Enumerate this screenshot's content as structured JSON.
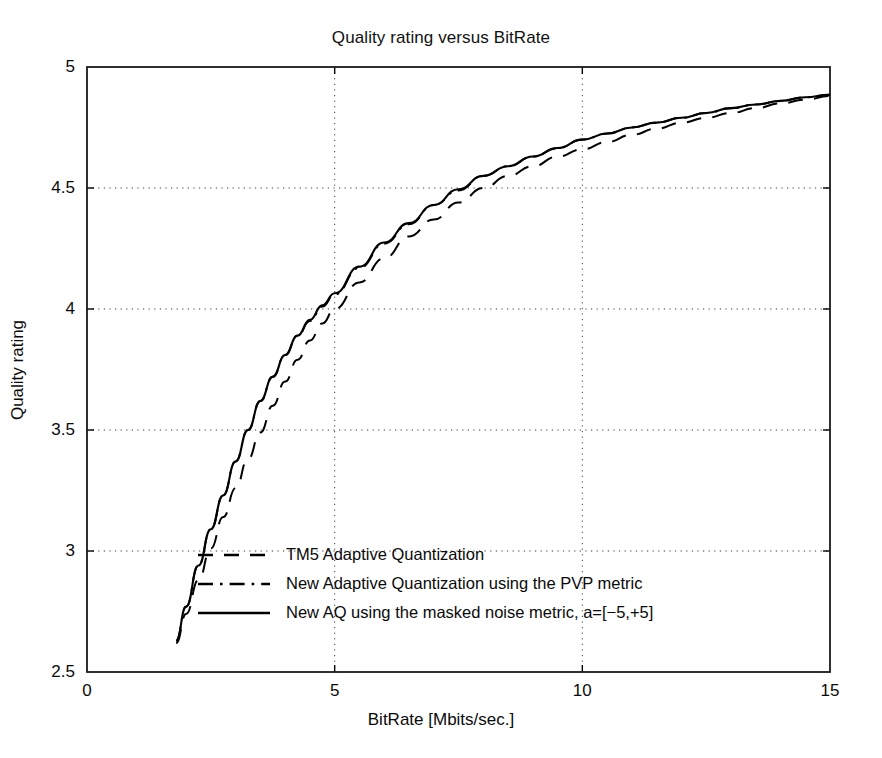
{
  "chart_data": {
    "type": "line",
    "title": "Quality rating versus BitRate",
    "xlabel": "BitRate [Mbits/sec.]",
    "ylabel": "Quality rating",
    "xlim": [
      0,
      15
    ],
    "ylim": [
      2.5,
      5
    ],
    "xticks": [
      0,
      5,
      10,
      15
    ],
    "xtick_labels": [
      "0",
      "5",
      "10",
      "15"
    ],
    "yticks": [
      2.5,
      3,
      3.5,
      4,
      4.5,
      5
    ],
    "ytick_labels": [
      "2.5",
      "3",
      "3.5",
      "4",
      "4.5",
      "5"
    ],
    "grid": "dotted-major",
    "legend_position": "lower-center-inside",
    "series": [
      {
        "name": "TM5 Adaptive Quantization",
        "style": "dashed",
        "color": "#000000",
        "x": [
          1.8,
          2.0,
          2.25,
          2.5,
          2.75,
          3.0,
          3.25,
          3.5,
          3.75,
          4.0,
          4.25,
          4.5,
          4.75,
          5.0,
          5.5,
          6.0,
          6.5,
          7.0,
          7.5,
          8.0,
          8.5,
          9.0,
          9.5,
          10.0,
          10.5,
          11.0,
          11.5,
          12.0,
          12.5,
          13.0,
          13.5,
          14.0,
          14.5,
          15.0
        ],
        "y": [
          2.62,
          2.74,
          2.88,
          3.01,
          3.14,
          3.26,
          3.38,
          3.49,
          3.6,
          3.7,
          3.79,
          3.87,
          3.94,
          4.0,
          4.11,
          4.21,
          4.3,
          4.37,
          4.44,
          4.5,
          4.55,
          4.59,
          4.63,
          4.66,
          4.69,
          4.72,
          4.745,
          4.77,
          4.79,
          4.81,
          4.83,
          4.85,
          4.865,
          4.88
        ]
      },
      {
        "name": "New Adaptive Quantization using the PVP metric",
        "style": "dash-dot",
        "color": "#000000",
        "x": [
          1.8,
          2.0,
          2.25,
          2.5,
          2.75,
          3.0,
          3.25,
          3.5,
          3.75,
          4.0,
          4.25,
          4.5,
          4.75,
          5.0,
          5.5,
          6.0,
          6.5,
          7.0,
          7.5,
          8.0,
          8.5,
          9.0,
          9.5,
          10.0,
          10.5,
          11.0,
          11.5,
          12.0,
          12.5,
          13.0,
          13.5,
          14.0,
          14.5,
          15.0
        ],
        "y": [
          2.63,
          2.77,
          2.94,
          3.09,
          3.23,
          3.37,
          3.5,
          3.62,
          3.72,
          3.81,
          3.89,
          3.95,
          4.01,
          4.06,
          4.17,
          4.27,
          4.35,
          4.43,
          4.49,
          4.55,
          4.59,
          4.63,
          4.665,
          4.7,
          4.725,
          4.75,
          4.77,
          4.79,
          4.81,
          4.83,
          4.845,
          4.86,
          4.875,
          4.885
        ]
      },
      {
        "name": "New AQ using the masked noise metric, a=[−5,+5]",
        "style": "solid",
        "color": "#000000",
        "x": [
          1.8,
          2.0,
          2.25,
          2.5,
          2.75,
          3.0,
          3.25,
          3.5,
          3.75,
          4.0,
          4.25,
          4.5,
          4.75,
          5.0,
          5.5,
          6.0,
          6.5,
          7.0,
          7.5,
          8.0,
          8.5,
          9.0,
          9.5,
          10.0,
          10.5,
          11.0,
          11.5,
          12.0,
          12.5,
          13.0,
          13.5,
          14.0,
          14.5,
          15.0
        ],
        "y": [
          2.63,
          2.77,
          2.94,
          3.09,
          3.23,
          3.37,
          3.5,
          3.62,
          3.72,
          3.81,
          3.89,
          3.955,
          4.015,
          4.065,
          4.175,
          4.275,
          4.355,
          4.43,
          4.495,
          4.55,
          4.59,
          4.63,
          4.665,
          4.7,
          4.725,
          4.75,
          4.77,
          4.79,
          4.81,
          4.83,
          4.845,
          4.86,
          4.875,
          4.885
        ]
      }
    ]
  },
  "legend": {
    "entries": [
      {
        "label": "TM5 Adaptive Quantization",
        "style": "dashed"
      },
      {
        "label": "New Adaptive Quantization using the PVP metric",
        "style": "dash-dot"
      },
      {
        "label": "New AQ using the masked noise metric, a=[−5,+5]",
        "style": "solid"
      }
    ]
  }
}
